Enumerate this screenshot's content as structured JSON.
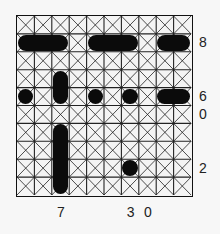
{
  "puzzle": {
    "cols": 10,
    "rows": 10,
    "row_clues": [
      {
        "row": 2,
        "label": "8"
      },
      {
        "row": 5,
        "label": "6"
      },
      {
        "row": 6,
        "label": "0"
      },
      {
        "row": 9,
        "label": "2"
      }
    ],
    "col_clues": [
      {
        "col": 3,
        "label": "7"
      },
      {
        "col": 7,
        "label": "3"
      },
      {
        "col": 8,
        "label": "0"
      }
    ],
    "pieces": [
      {
        "row": 2,
        "col": 1,
        "w": 3,
        "h": 1
      },
      {
        "row": 2,
        "col": 5,
        "w": 3,
        "h": 1
      },
      {
        "row": 2,
        "col": 9,
        "w": 2,
        "h": 1
      },
      {
        "row": 4,
        "col": 3,
        "w": 1,
        "h": 2
      },
      {
        "row": 5,
        "col": 1,
        "w": 1,
        "h": 1
      },
      {
        "row": 5,
        "col": 5,
        "w": 1,
        "h": 1
      },
      {
        "row": 5,
        "col": 7,
        "w": 1,
        "h": 1
      },
      {
        "row": 5,
        "col": 9,
        "w": 2,
        "h": 1
      },
      {
        "row": 7,
        "col": 3,
        "w": 1,
        "h": 4
      },
      {
        "row": 9,
        "col": 7,
        "w": 1,
        "h": 1
      }
    ]
  }
}
